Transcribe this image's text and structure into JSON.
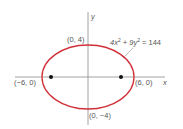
{
  "diagram": {
    "equation": {
      "parts": [
        "4x",
        "2",
        " + 9y",
        "2",
        " = 144"
      ],
      "full": "4x² + 9y² = 144"
    },
    "axes": {
      "x_label": "x",
      "y_label": "y"
    },
    "points": {
      "top": "(0, 4)",
      "bottom": "(0, −4)",
      "left": "(−6, 0)",
      "right": "(6, 0)"
    },
    "colors": {
      "ellipse": "#d0303a",
      "axis": "#8a8a8a",
      "text": "#555555",
      "focus": "#111111"
    }
  }
}
